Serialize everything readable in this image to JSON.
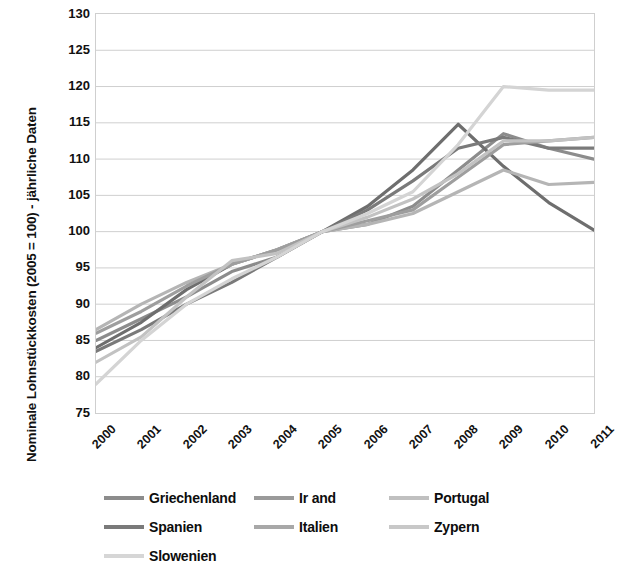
{
  "chart_data": {
    "type": "line",
    "title": "",
    "xlabel": "",
    "ylabel": "Nominale Lohnstückkosten (2005 = 100) - jährliche Daten",
    "x": [
      2000,
      2001,
      2002,
      2003,
      2004,
      2005,
      2006,
      2007,
      2008,
      2009,
      2010,
      2011
    ],
    "categories": [
      "2000",
      "2001",
      "2002",
      "2003",
      "2004",
      "2005",
      "2006",
      "2007",
      "2008",
      "2009",
      "2010",
      "2011"
    ],
    "xlim": [
      2000,
      2011
    ],
    "ylim": [
      75,
      130
    ],
    "yticks": [
      75,
      80,
      85,
      90,
      95,
      100,
      105,
      110,
      115,
      120,
      125,
      130
    ],
    "grid": true,
    "legend_position": "bottom",
    "series": [
      {
        "name": "Griechenland",
        "color": "#8c8c8c",
        "values": [
          85.0,
          88.0,
          91.0,
          94.5,
          96.5,
          100.0,
          101.0,
          103.5,
          108.5,
          113.5,
          111.5,
          110.0
        ]
      },
      {
        "name": "Irland",
        "color": "#6e6e6e",
        "values": [
          84.0,
          87.5,
          92.0,
          95.5,
          97.5,
          100.0,
          103.5,
          108.5,
          114.8,
          109.0,
          104.0,
          100.2
        ]
      },
      {
        "name": "Portugal",
        "color": "#b5b5b5",
        "values": [
          86.5,
          90.0,
          93.0,
          95.5,
          97.5,
          100.0,
          101.0,
          102.5,
          105.5,
          108.5,
          106.5,
          106.8
        ]
      },
      {
        "name": "Spanien",
        "color": "#7a7a7a",
        "values": [
          83.5,
          86.5,
          90.0,
          93.0,
          96.5,
          100.0,
          103.0,
          107.0,
          111.5,
          113.0,
          111.5,
          111.5
        ]
      },
      {
        "name": "Italien",
        "color": "#9e9e9e",
        "values": [
          86.0,
          89.0,
          92.5,
          95.5,
          97.5,
          100.0,
          101.5,
          103.0,
          107.5,
          112.0,
          112.5,
          113.0
        ]
      },
      {
        "name": "Zypern",
        "color": "#c2c2c2",
        "values": [
          82.0,
          85.5,
          91.0,
          96.0,
          97.0,
          100.0,
          102.0,
          104.5,
          108.0,
          112.5,
          112.5,
          113.0
        ]
      },
      {
        "name": "Slowenien",
        "color": "#d4d4d4",
        "values": [
          79.0,
          85.0,
          90.0,
          93.5,
          96.5,
          100.0,
          102.5,
          105.5,
          112.0,
          120.0,
          119.5,
          119.5
        ]
      }
    ]
  },
  "axis": {
    "y_title": "Nominale Lohnstückkosten (2005 = 100) - jährliche Daten",
    "y_tick_labels": [
      "130",
      "125",
      "120",
      "115",
      "110",
      "105",
      "100",
      "95",
      "90",
      "85",
      "80",
      "75"
    ],
    "x_tick_labels": [
      "2000",
      "2001",
      "2002",
      "2003",
      "2004",
      "2005",
      "2006",
      "2007",
      "2008",
      "2009",
      "2010",
      "2011"
    ]
  },
  "legend": {
    "rows": [
      [
        {
          "label": "Griechenland",
          "color": "#8c8c8c"
        },
        {
          "label": "Ir and",
          "color": "#9a9a9a"
        },
        {
          "label": "Portugal",
          "color": "#c0c0c0"
        }
      ],
      [
        {
          "label": "Spanien",
          "color": "#7a7a7a"
        },
        {
          "label": "Italien",
          "color": "#a8a8a8"
        },
        {
          "label": "Zypern",
          "color": "#c8c8c8"
        }
      ],
      [
        {
          "label": "Slowenien",
          "color": "#d6d6d6"
        }
      ]
    ]
  },
  "style": {
    "grid_color": "#cfcfcf",
    "plot_border_color": "#cfcfcf",
    "background": "#ffffff",
    "text_color": "#111111"
  }
}
